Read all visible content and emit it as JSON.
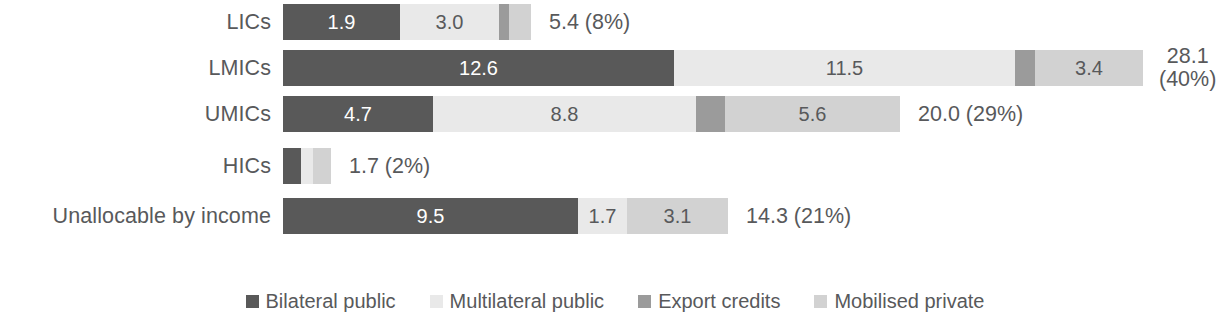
{
  "chart_data": {
    "type": "bar",
    "orientation": "horizontal",
    "stacked": true,
    "title": "",
    "xlabel": "",
    "ylabel": "",
    "grid": false,
    "legend_position": "bottom",
    "categories": [
      "LICs",
      "LMICs",
      "UMICs",
      "HICs",
      "Unallocable by income"
    ],
    "series": [
      {
        "name": "Bilateral public",
        "color": "#595959",
        "values": [
          1.9,
          12.6,
          4.7,
          0.7,
          9.5
        ]
      },
      {
        "name": "Multilateral public",
        "color": "#e9e9e9",
        "values": [
          3.0,
          11.5,
          8.8,
          0.3,
          1.7
        ]
      },
      {
        "name": "Export credits",
        "color": "#9b9b9b",
        "values": [
          0.2,
          0.3,
          0.5,
          0.0,
          0.0
        ]
      },
      {
        "name": "Mobilised private",
        "color": "#d2d2d2",
        "values": [
          0.3,
          3.4,
          5.6,
          0.7,
          3.1
        ]
      }
    ],
    "totals": [
      "5.4 (8%)",
      "28.1\n(40%)",
      "20.0 (29%)",
      "1.7 (2%)",
      "14.3 (21%)"
    ],
    "total_values": [
      5.4,
      28.1,
      20.0,
      1.7,
      14.3
    ],
    "total_percents": [
      "8%",
      "40%",
      "29%",
      "2%",
      "21%"
    ]
  },
  "rows": [
    {
      "label": "LICs",
      "total": "5.4 (8%)",
      "total_line1": "5.4 (8%)",
      "total_line2": "",
      "segments": [
        {
          "name": "Bilateral public",
          "value": "1.9",
          "show": true,
          "px": 117,
          "shade": "dark"
        },
        {
          "name": "Multilateral public",
          "value": "3.0",
          "show": true,
          "px": 99,
          "shade": "light"
        },
        {
          "name": "Export credits",
          "value": "",
          "show": false,
          "px": 10,
          "shade": "mid"
        },
        {
          "name": "Mobilised private",
          "value": "",
          "show": false,
          "px": 22,
          "shade": "lightmid"
        }
      ]
    },
    {
      "label": "LMICs",
      "total": "28.1 (40%)",
      "total_line1": "28.1",
      "total_line2": "(40%)",
      "segments": [
        {
          "name": "Bilateral public",
          "value": "12.6",
          "show": true,
          "px": 391,
          "shade": "dark"
        },
        {
          "name": "Multilateral public",
          "value": "11.5",
          "show": true,
          "px": 341,
          "shade": "light"
        },
        {
          "name": "Export credits",
          "value": "",
          "show": false,
          "px": 20,
          "shade": "mid"
        },
        {
          "name": "Mobilised private",
          "value": "3.4",
          "show": true,
          "px": 108,
          "shade": "lightmid"
        }
      ]
    },
    {
      "label": "UMICs",
      "total": "20.0 (29%)",
      "total_line1": "20.0 (29%)",
      "total_line2": "",
      "segments": [
        {
          "name": "Bilateral public",
          "value": "4.7",
          "show": true,
          "px": 150,
          "shade": "dark"
        },
        {
          "name": "Multilateral public",
          "value": "8.8",
          "show": true,
          "px": 263,
          "shade": "light"
        },
        {
          "name": "Export credits",
          "value": "",
          "show": false,
          "px": 29,
          "shade": "mid"
        },
        {
          "name": "Mobilised private",
          "value": "5.6",
          "show": true,
          "px": 175,
          "shade": "lightmid"
        }
      ]
    },
    {
      "label": "HICs",
      "total": "1.7 (2%)",
      "total_line1": "1.7 (2%)",
      "total_line2": "",
      "segments": [
        {
          "name": "Bilateral public",
          "value": "",
          "show": false,
          "px": 18,
          "shade": "dark"
        },
        {
          "name": "Multilateral public",
          "value": "",
          "show": false,
          "px": 12,
          "shade": "light"
        },
        {
          "name": "Export credits",
          "value": "",
          "show": false,
          "px": 0,
          "shade": "mid"
        },
        {
          "name": "Mobilised private",
          "value": "",
          "show": false,
          "px": 18,
          "shade": "lightmid"
        }
      ]
    },
    {
      "label": "Unallocable by income",
      "total": "14.3 (21%)",
      "total_line1": "14.3 (21%)",
      "total_line2": "",
      "segments": [
        {
          "name": "Bilateral public",
          "value": "9.5",
          "show": true,
          "px": 295,
          "shade": "dark"
        },
        {
          "name": "Multilateral public",
          "value": "1.7",
          "show": true,
          "px": 49,
          "shade": "light"
        },
        {
          "name": "Export credits",
          "value": "",
          "show": false,
          "px": 0,
          "shade": "mid"
        },
        {
          "name": "Mobilised private",
          "value": "3.1",
          "show": true,
          "px": 101,
          "shade": "lightmid"
        }
      ]
    }
  ],
  "legend": {
    "items": [
      {
        "label": "Bilateral public",
        "color": "#595959"
      },
      {
        "label": "Multilateral public",
        "color": "#e9e9e9"
      },
      {
        "label": "Export credits",
        "color": "#9b9b9b"
      },
      {
        "label": "Mobilised private",
        "color": "#d2d2d2"
      }
    ]
  },
  "colors": {
    "bilateral_public": "#595959",
    "multilateral_public": "#e9e9e9",
    "export_credits": "#9b9b9b",
    "mobilised_private": "#d2d2d2",
    "text": "#58595b",
    "background": "#ffffff"
  }
}
